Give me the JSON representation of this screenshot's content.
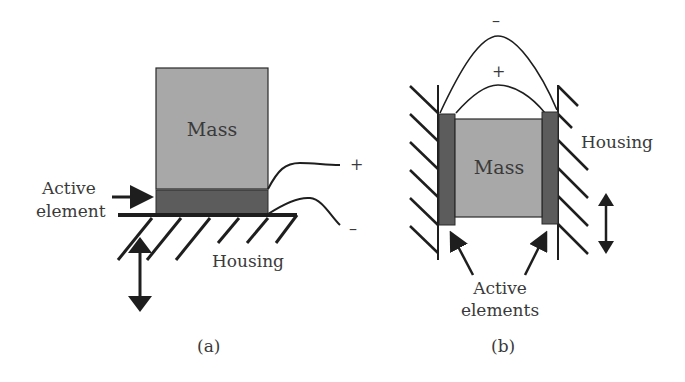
{
  "panel_a": {
    "caption": "(a)",
    "mass_label": "Mass",
    "active_label_line1": "Active",
    "active_label_line2": "element",
    "housing_label": "Housing",
    "plus": "+",
    "minus": "–"
  },
  "panel_b": {
    "caption": "(b)",
    "mass_label": "Mass",
    "housing_label": "Housing",
    "active_label_line1": "Active",
    "active_label_line2": "elements",
    "plus": "+",
    "minus": "–"
  },
  "colors": {
    "mass": "#a8a8a8",
    "active": "#5c5c5c",
    "line": "#1e1e1e",
    "text": "#3a3a3a"
  }
}
